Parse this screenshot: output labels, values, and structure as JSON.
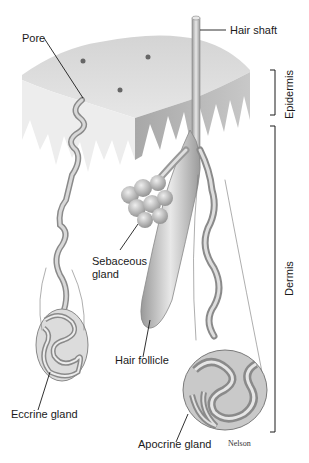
{
  "diagram": {
    "labels": {
      "pore": "Pore",
      "hair_shaft": "Hair shaft",
      "sebaceous_gland_line1": "Sebaceous",
      "sebaceous_gland_line2": "gland",
      "hair_follicle": "Hair follicle",
      "eccrine_gland": "Eccrine gland",
      "apocrine_gland": "Apocrine gland"
    },
    "layers": {
      "epidermis": "Epidermis",
      "dermis": "Dermis"
    },
    "credit": "Nelson",
    "colors": {
      "skin_surface": "#d9d9d9",
      "skin_side": "#bdbdbd",
      "gland": "#b3b3b3",
      "line": "#1a1a1a"
    }
  }
}
